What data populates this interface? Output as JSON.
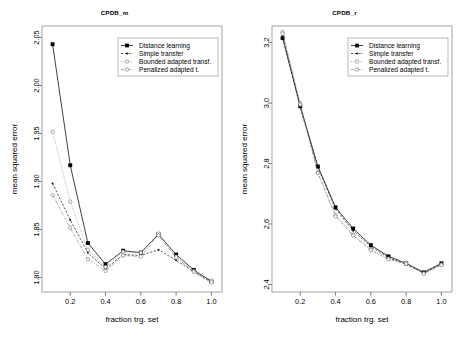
{
  "figure": {
    "xlabel": "fraction trg. set",
    "ylabel": "mean squared error"
  },
  "legend": {
    "entries": [
      {
        "label": "Distance learning",
        "marker": "filled-square",
        "line": "solid",
        "color": "#000000"
      },
      {
        "label": "Simple transfer",
        "marker": "small-dot",
        "line": "dashed",
        "color": "#000000"
      },
      {
        "label": "Bounded adapted transf.",
        "marker": "open-circle",
        "line": "dotted",
        "color": "#6e6e6e"
      },
      {
        "label": "Penalized adapted t.",
        "marker": "open-circle",
        "line": "dashdot",
        "color": "#6e6e6e"
      }
    ]
  },
  "chart_data": [
    {
      "type": "line",
      "title": "CPDB_m",
      "xlabel": "fraction trg. set",
      "ylabel": "mean squared error",
      "xlim": [
        0.04,
        1.06
      ],
      "ylim": [
        1.785,
        2.062
      ],
      "xticks": [
        0.2,
        0.4,
        0.6,
        0.8,
        1.0
      ],
      "yticks": [
        1.8,
        1.85,
        1.9,
        1.95,
        2.0,
        2.05
      ],
      "xticklabels": [
        "0.2",
        "0.4",
        "0.6",
        "0.8",
        "1.0"
      ],
      "yticklabels": [
        "1.80",
        "1.85",
        "1.90",
        "1.95",
        "2.00",
        "2.05"
      ],
      "grid": false,
      "legend_position": "top-right",
      "x": [
        0.1,
        0.2,
        0.3,
        0.4,
        0.5,
        0.6,
        0.7,
        0.8,
        0.9,
        1.0
      ],
      "series": [
        {
          "name": "Distance learning",
          "values": [
            2.043,
            1.917,
            1.836,
            1.814,
            1.828,
            1.826,
            1.845,
            1.824,
            1.808,
            1.796
          ]
        },
        {
          "name": "Simple transfer",
          "values": [
            1.898,
            1.86,
            1.826,
            1.809,
            1.824,
            1.823,
            1.829,
            1.818,
            1.806,
            1.795
          ]
        },
        {
          "name": "Bounded adapted transf.",
          "values": [
            1.952,
            1.879,
            1.829,
            1.811,
            1.827,
            1.826,
            1.846,
            1.822,
            1.807,
            1.797
          ]
        },
        {
          "name": "Penalized adapted t.",
          "values": [
            1.886,
            1.852,
            1.819,
            1.807,
            1.823,
            1.822,
            1.844,
            1.821,
            1.806,
            1.795
          ]
        }
      ]
    },
    {
      "type": "line",
      "title": "CPDB_r",
      "xlabel": "fraction trg. set",
      "ylabel": "mean squared error",
      "xlim": [
        0.04,
        1.06
      ],
      "ylim": [
        2.375,
        3.255
      ],
      "xticks": [
        0.2,
        0.4,
        0.6,
        0.8,
        1.0
      ],
      "yticks": [
        2.4,
        2.6,
        2.8,
        3.0,
        3.2
      ],
      "xticklabels": [
        "0.2",
        "0.4",
        "0.6",
        "0.8",
        "1.0"
      ],
      "yticklabels": [
        "2.4",
        "2.6",
        "2.8",
        "3.0",
        "3.2"
      ],
      "grid": false,
      "legend_position": "top-right",
      "x": [
        0.1,
        0.2,
        0.3,
        0.4,
        0.5,
        0.6,
        0.7,
        0.8,
        0.9,
        1.0
      ],
      "series": [
        {
          "name": "Distance learning",
          "values": [
            3.215,
            2.99,
            2.79,
            2.655,
            2.585,
            2.53,
            2.493,
            2.47,
            2.44,
            2.47
          ]
        },
        {
          "name": "Simple transfer",
          "values": [
            3.225,
            2.985,
            2.788,
            2.65,
            2.578,
            2.525,
            2.489,
            2.466,
            2.438,
            2.468
          ]
        },
        {
          "name": "Bounded adapted transf.",
          "values": [
            3.235,
            3.0,
            2.77,
            2.628,
            2.565,
            2.516,
            2.486,
            2.472,
            2.437,
            2.466
          ]
        },
        {
          "name": "Penalized adapted t.",
          "values": [
            3.23,
            2.995,
            2.768,
            2.625,
            2.562,
            2.513,
            2.483,
            2.468,
            2.435,
            2.464
          ]
        }
      ]
    }
  ]
}
